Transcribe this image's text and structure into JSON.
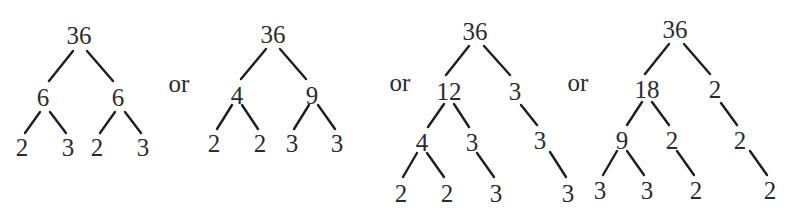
{
  "figure": {
    "separator_label": "or",
    "separators": [
      {
        "x": 179,
        "y": 83
      },
      {
        "x": 400,
        "y": 82
      },
      {
        "x": 578,
        "y": 82
      }
    ],
    "trees": [
      {
        "name": "tree-6x6",
        "nodes": [
          {
            "id": "r",
            "label": "36",
            "x": 79,
            "y": 35
          },
          {
            "id": "a",
            "label": "6",
            "x": 43,
            "y": 97
          },
          {
            "id": "b",
            "label": "6",
            "x": 118,
            "y": 97
          },
          {
            "id": "a1",
            "label": "2",
            "x": 22,
            "y": 147
          },
          {
            "id": "a2",
            "label": "3",
            "x": 68,
            "y": 147
          },
          {
            "id": "b1",
            "label": "2",
            "x": 97,
            "y": 147
          },
          {
            "id": "b2",
            "label": "3",
            "x": 143,
            "y": 147
          }
        ],
        "edges": [
          {
            "x1": 73,
            "y1": 51,
            "x2": 49,
            "y2": 81
          },
          {
            "x1": 87,
            "y1": 51,
            "x2": 113,
            "y2": 81
          },
          {
            "x1": 40,
            "y1": 112,
            "x2": 25,
            "y2": 133
          },
          {
            "x1": 50,
            "y1": 112,
            "x2": 66,
            "y2": 133
          },
          {
            "x1": 115,
            "y1": 112,
            "x2": 100,
            "y2": 133
          },
          {
            "x1": 125,
            "y1": 112,
            "x2": 141,
            "y2": 133
          }
        ]
      },
      {
        "name": "tree-4x9",
        "nodes": [
          {
            "id": "r",
            "label": "36",
            "x": 273,
            "y": 34
          },
          {
            "id": "a",
            "label": "4",
            "x": 237,
            "y": 95
          },
          {
            "id": "b",
            "label": "9",
            "x": 312,
            "y": 95
          },
          {
            "id": "a1",
            "label": "2",
            "x": 214,
            "y": 143
          },
          {
            "id": "a2",
            "label": "2",
            "x": 260,
            "y": 143
          },
          {
            "id": "b1",
            "label": "3",
            "x": 292,
            "y": 143
          },
          {
            "id": "b2",
            "label": "3",
            "x": 337,
            "y": 143
          }
        ],
        "edges": [
          {
            "x1": 266,
            "y1": 49,
            "x2": 241,
            "y2": 79
          },
          {
            "x1": 280,
            "y1": 49,
            "x2": 306,
            "y2": 79
          },
          {
            "x1": 232,
            "y1": 105,
            "x2": 217,
            "y2": 129
          },
          {
            "x1": 242,
            "y1": 105,
            "x2": 258,
            "y2": 129
          },
          {
            "x1": 309,
            "y1": 105,
            "x2": 294,
            "y2": 129
          },
          {
            "x1": 318,
            "y1": 105,
            "x2": 335,
            "y2": 129
          }
        ]
      },
      {
        "name": "tree-12x3",
        "nodes": [
          {
            "id": "r",
            "label": "36",
            "x": 475,
            "y": 31
          },
          {
            "id": "a",
            "label": "12",
            "x": 449,
            "y": 91
          },
          {
            "id": "b",
            "label": "3",
            "x": 515,
            "y": 91
          },
          {
            "id": "a1",
            "label": "4",
            "x": 422,
            "y": 142
          },
          {
            "id": "a2",
            "label": "3",
            "x": 472,
            "y": 142
          },
          {
            "id": "b1",
            "label": "3",
            "x": 540,
            "y": 140
          },
          {
            "id": "a11",
            "label": "2",
            "x": 401,
            "y": 193
          },
          {
            "id": "a12",
            "label": "2",
            "x": 447,
            "y": 193
          },
          {
            "id": "a21",
            "label": "3",
            "x": 496,
            "y": 193
          },
          {
            "id": "b11",
            "label": "3",
            "x": 568,
            "y": 193
          }
        ],
        "edges": [
          {
            "x1": 469,
            "y1": 46,
            "x2": 446,
            "y2": 75
          },
          {
            "x1": 484,
            "y1": 46,
            "x2": 510,
            "y2": 75
          },
          {
            "x1": 444,
            "y1": 104,
            "x2": 428,
            "y2": 127
          },
          {
            "x1": 454,
            "y1": 104,
            "x2": 469,
            "y2": 127
          },
          {
            "x1": 521,
            "y1": 105,
            "x2": 537,
            "y2": 125
          },
          {
            "x1": 417,
            "y1": 153,
            "x2": 403,
            "y2": 177
          },
          {
            "x1": 427,
            "y1": 153,
            "x2": 444,
            "y2": 177
          },
          {
            "x1": 477,
            "y1": 153,
            "x2": 494,
            "y2": 177
          },
          {
            "x1": 550,
            "y1": 152,
            "x2": 566,
            "y2": 177
          }
        ]
      },
      {
        "name": "tree-18x2",
        "nodes": [
          {
            "id": "r",
            "label": "36",
            "x": 675,
            "y": 29
          },
          {
            "id": "a",
            "label": "18",
            "x": 647,
            "y": 89
          },
          {
            "id": "b",
            "label": "2",
            "x": 715,
            "y": 89
          },
          {
            "id": "a1",
            "label": "9",
            "x": 622,
            "y": 140
          },
          {
            "id": "a2",
            "label": "2",
            "x": 672,
            "y": 140
          },
          {
            "id": "b1",
            "label": "2",
            "x": 740,
            "y": 140
          },
          {
            "id": "a11",
            "label": "3",
            "x": 600,
            "y": 190
          },
          {
            "id": "a12",
            "label": "3",
            "x": 647,
            "y": 190
          },
          {
            "id": "a21",
            "label": "2",
            "x": 696,
            "y": 190
          },
          {
            "id": "b11",
            "label": "2",
            "x": 770,
            "y": 190
          }
        ],
        "edges": [
          {
            "x1": 669,
            "y1": 44,
            "x2": 645,
            "y2": 74
          },
          {
            "x1": 684,
            "y1": 44,
            "x2": 710,
            "y2": 74
          },
          {
            "x1": 642,
            "y1": 102,
            "x2": 627,
            "y2": 125
          },
          {
            "x1": 652,
            "y1": 102,
            "x2": 669,
            "y2": 125
          },
          {
            "x1": 721,
            "y1": 103,
            "x2": 737,
            "y2": 125
          },
          {
            "x1": 617,
            "y1": 151,
            "x2": 603,
            "y2": 175
          },
          {
            "x1": 627,
            "y1": 151,
            "x2": 644,
            "y2": 175
          },
          {
            "x1": 677,
            "y1": 151,
            "x2": 694,
            "y2": 175
          },
          {
            "x1": 750,
            "y1": 151,
            "x2": 767,
            "y2": 175
          }
        ]
      }
    ]
  }
}
